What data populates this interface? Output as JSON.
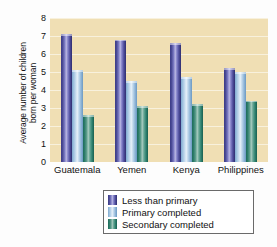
{
  "chart_data": {
    "type": "bar",
    "title": "",
    "xlabel": "",
    "ylabel": "Average number of children born per woman",
    "ylabel_line1": "Average number of children",
    "ylabel_line2": "born per woman",
    "ylim": [
      0,
      8
    ],
    "yticks": [
      0,
      1,
      2,
      3,
      4,
      5,
      6,
      7,
      8
    ],
    "grid": true,
    "legend_position": "bottom",
    "categories": [
      "Guatemala",
      "Yemen",
      "Kenya",
      "Philippines"
    ],
    "series": [
      {
        "name": "Less than primary",
        "color": "#3b3a86",
        "values": [
          7.1,
          6.8,
          6.6,
          5.2
        ]
      },
      {
        "name": "Primary completed",
        "color": "#b6d4ea",
        "values": [
          5.1,
          4.5,
          4.7,
          5.0
        ]
      },
      {
        "name": "Secondary completed",
        "color": "#2c7c69",
        "values": [
          2.6,
          3.1,
          3.2,
          3.4
        ]
      }
    ],
    "plot_background": "#f0dfb4",
    "page_background": "#fdfdfd"
  }
}
